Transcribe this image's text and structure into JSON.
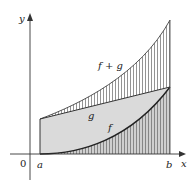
{
  "diagram": {
    "axes": {
      "x_label": "x",
      "y_label": "y",
      "origin_label": "0"
    },
    "ticks": {
      "a_label": "a",
      "b_label": "b"
    },
    "curves": {
      "f_label": "f",
      "g_label": "g",
      "f_plus_g_label": "f + g"
    },
    "colors": {
      "shaded_region": "#d9d9d9",
      "hatch_lines": "#555555",
      "curve_stroke": "#222222",
      "axis_stroke": "#333333"
    }
  }
}
